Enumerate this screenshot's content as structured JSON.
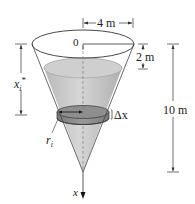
{
  "figure": {
    "labels": {
      "top_radius": "4 m",
      "depth_to_water": "2 m",
      "height": "10 m",
      "origin": "0",
      "slab_depth": "x",
      "slab_depth_sub": "i",
      "slab_depth_star": "*",
      "slab_radius": "r",
      "slab_radius_sub": "i",
      "slab_thickness": "Δx",
      "axis": "x"
    },
    "colors": {
      "water": "#c8c8c8",
      "water_dark": "#a9a9a9",
      "slab": "#8c8c8c",
      "line": "#333333"
    }
  }
}
